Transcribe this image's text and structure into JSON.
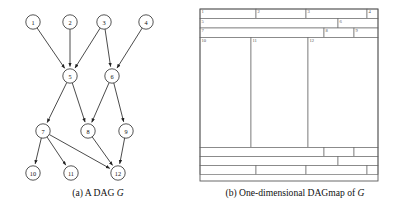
{
  "figure": {
    "background": "#ffffff",
    "line_color": "#3a3a3a",
    "label_color": "#555555"
  },
  "panel_a": {
    "caption_prefix": "(a)",
    "caption_text": "A DAG",
    "caption_italic": "G",
    "nodes": [
      {
        "id": "1",
        "label": "1",
        "cx": 33,
        "cy": 22
      },
      {
        "id": "2",
        "label": "2",
        "cx": 70,
        "cy": 22
      },
      {
        "id": "3",
        "label": "3",
        "cx": 104,
        "cy": 22
      },
      {
        "id": "4",
        "label": "4",
        "cx": 146,
        "cy": 22
      },
      {
        "id": "5",
        "label": "5",
        "cx": 70,
        "cy": 76
      },
      {
        "id": "6",
        "label": "6",
        "cx": 112,
        "cy": 76
      },
      {
        "id": "7",
        "label": "7",
        "cx": 43,
        "cy": 131
      },
      {
        "id": "8",
        "label": "8",
        "cx": 88,
        "cy": 131
      },
      {
        "id": "9",
        "label": "9",
        "cx": 126,
        "cy": 131
      },
      {
        "id": "10",
        "label": "10",
        "cx": 33,
        "cy": 173
      },
      {
        "id": "11",
        "label": "11",
        "cx": 71,
        "cy": 173
      },
      {
        "id": "12",
        "label": "12",
        "cx": 118,
        "cy": 173
      }
    ],
    "node_radius": 7.2,
    "edges": [
      {
        "from": "1",
        "to": "5"
      },
      {
        "from": "2",
        "to": "5"
      },
      {
        "from": "3",
        "to": "5"
      },
      {
        "from": "3",
        "to": "6"
      },
      {
        "from": "4",
        "to": "6"
      },
      {
        "from": "5",
        "to": "7"
      },
      {
        "from": "5",
        "to": "8"
      },
      {
        "from": "6",
        "to": "8"
      },
      {
        "from": "6",
        "to": "9"
      },
      {
        "from": "7",
        "to": "10"
      },
      {
        "from": "7",
        "to": "11"
      },
      {
        "from": "7",
        "to": "12"
      },
      {
        "from": "8",
        "to": "12"
      },
      {
        "from": "9",
        "to": "12"
      }
    ]
  },
  "panel_b": {
    "caption_prefix": "(b)",
    "caption_text": "One-dimensional DAGmap of",
    "caption_italic": "G",
    "frame": {
      "x": 4,
      "y": 9,
      "w": 178,
      "h": 172
    },
    "rows": [
      {
        "name": "row-top-sources",
        "y": 9,
        "h": 9.5,
        "cells": [
          {
            "label": "1",
            "x": 4,
            "w": 56
          },
          {
            "label": "2",
            "x": 60,
            "w": 50
          },
          {
            "label": "3",
            "x": 110,
            "w": 61
          },
          {
            "label": "4",
            "x": 171,
            "w": 11
          }
        ]
      },
      {
        "name": "row-level-two",
        "y": 18.5,
        "h": 9.5,
        "cells": [
          {
            "label": "5",
            "x": 4,
            "w": 138
          },
          {
            "label": "6",
            "x": 142,
            "w": 40
          }
        ]
      },
      {
        "name": "row-level-three",
        "y": 28,
        "h": 9.5,
        "cells": [
          {
            "label": "7",
            "x": 4,
            "w": 124
          },
          {
            "label": "8",
            "x": 128,
            "w": 30
          },
          {
            "label": "9",
            "x": 158,
            "w": 24
          }
        ]
      },
      {
        "name": "row-sinks",
        "y": 37.5,
        "h": 110,
        "cells": [
          {
            "label": "10",
            "x": 4,
            "w": 51
          },
          {
            "label": "11",
            "x": 55,
            "w": 57
          },
          {
            "label": "12",
            "x": 112,
            "w": 70
          }
        ]
      },
      {
        "name": "row-mirror-three",
        "y": 147.5,
        "h": 9,
        "cells": [
          {
            "label": "",
            "x": 4,
            "w": 124
          },
          {
            "label": "",
            "x": 128,
            "w": 30
          },
          {
            "label": "",
            "x": 158,
            "w": 24
          }
        ]
      },
      {
        "name": "row-mirror-two",
        "y": 156.5,
        "h": 9,
        "cells": [
          {
            "label": "",
            "x": 4,
            "w": 138
          },
          {
            "label": "",
            "x": 142,
            "w": 40
          }
        ]
      },
      {
        "name": "row-mirror-sources",
        "y": 165.5,
        "h": 9,
        "cells": [
          {
            "label": "",
            "x": 4,
            "w": 56
          },
          {
            "label": "",
            "x": 60,
            "w": 50
          },
          {
            "label": "",
            "x": 110,
            "w": 61
          },
          {
            "label": "",
            "x": 171,
            "w": 11
          }
        ]
      }
    ]
  }
}
